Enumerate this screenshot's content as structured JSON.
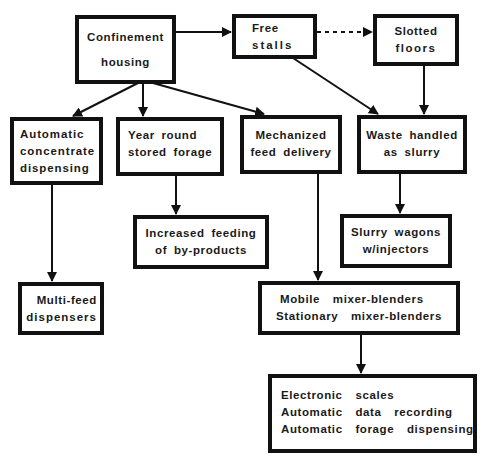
{
  "diagram": {
    "nodes": [
      {
        "id": "confinement",
        "lines": [
          "Confinement",
          "housing"
        ]
      },
      {
        "id": "free_stalls",
        "lines": [
          "Free",
          "stalls"
        ]
      },
      {
        "id": "slotted_floors",
        "lines": [
          "Slotted",
          "floors"
        ]
      },
      {
        "id": "auto_concentrate",
        "lines": [
          "Automatic",
          "concentrate",
          "dispensing"
        ]
      },
      {
        "id": "year_round_forage",
        "lines": [
          "Year round",
          "stored forage"
        ]
      },
      {
        "id": "mechanized_feed",
        "lines": [
          "Mechanized",
          "feed delivery"
        ]
      },
      {
        "id": "waste_slurry",
        "lines": [
          "Waste handled",
          "as slurry"
        ]
      },
      {
        "id": "byproducts",
        "lines": [
          "Increased feeding",
          "of by-products"
        ]
      },
      {
        "id": "slurry_wagons",
        "lines": [
          "Slurry wagons",
          "w/injectors"
        ]
      },
      {
        "id": "multi_feed",
        "lines": [
          "Multi-feed",
          "dispensers"
        ]
      },
      {
        "id": "mixer_blenders",
        "lines": [
          "Mobile mixer-blenders",
          "Stationary mixer-blenders"
        ]
      },
      {
        "id": "electronics",
        "lines": [
          "Electronic scales",
          "Automatic data recording",
          "Automatic forage dispensing"
        ]
      }
    ],
    "edges": [
      {
        "from": "confinement",
        "to": "free_stalls",
        "style": "solid"
      },
      {
        "from": "free_stalls",
        "to": "slotted_floors",
        "style": "dotted"
      },
      {
        "from": "confinement",
        "to": "auto_concentrate",
        "style": "solid"
      },
      {
        "from": "confinement",
        "to": "year_round_forage",
        "style": "solid"
      },
      {
        "from": "confinement",
        "to": "mechanized_feed",
        "style": "solid"
      },
      {
        "from": "free_stalls",
        "to": "waste_slurry",
        "style": "solid"
      },
      {
        "from": "slotted_floors",
        "to": "waste_slurry",
        "style": "solid"
      },
      {
        "from": "year_round_forage",
        "to": "byproducts",
        "style": "solid"
      },
      {
        "from": "waste_slurry",
        "to": "slurry_wagons",
        "style": "solid"
      },
      {
        "from": "auto_concentrate",
        "to": "multi_feed",
        "style": "solid"
      },
      {
        "from": "mechanized_feed",
        "to": "mixer_blenders",
        "style": "solid"
      },
      {
        "from": "mixer_blenders",
        "to": "electronics",
        "style": "solid"
      }
    ]
  }
}
